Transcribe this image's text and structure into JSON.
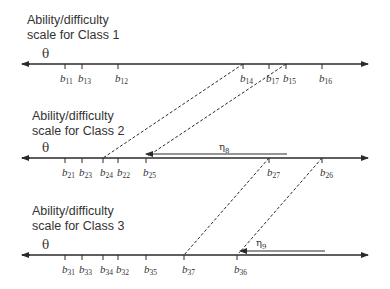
{
  "diagram": {
    "colors": {
      "line": "#2a2a2a",
      "text": "#333333",
      "background": "#ffffff"
    },
    "classes": [
      {
        "title_line1": "Ability/difficulty",
        "title_line2": "scale for Class 1",
        "theta": "θ",
        "ticks": [
          {
            "label": "b",
            "sub": "11",
            "x": 65
          },
          {
            "label": "b",
            "sub": "13",
            "x": 82
          },
          {
            "label": "b",
            "sub": "12",
            "x": 118
          },
          {
            "label": "b",
            "sub": "14",
            "x": 243
          },
          {
            "label": "b",
            "sub": "17",
            "x": 269
          },
          {
            "label": "b",
            "sub": "15",
            "x": 286
          },
          {
            "label": "b",
            "sub": "16",
            "x": 322
          }
        ]
      },
      {
        "title_line1": "Ability/difficulty",
        "title_line2": "scale for Class 2",
        "theta": "θ",
        "ticks": [
          {
            "label": "b",
            "sub": "21",
            "x": 65
          },
          {
            "label": "b",
            "sub": "23",
            "x": 82
          },
          {
            "label": "b",
            "sub": "24",
            "x": 103
          },
          {
            "label": "b",
            "sub": "22",
            "x": 118
          },
          {
            "label": "b",
            "sub": "25",
            "x": 146
          },
          {
            "label": "b",
            "sub": "27",
            "x": 269
          },
          {
            "label": "b",
            "sub": "26",
            "x": 322
          }
        ],
        "shift": {
          "symbol": "η",
          "sub": "8"
        }
      },
      {
        "title_line1": "Ability/difficulty",
        "title_line2": "scale for Class 3",
        "theta": "θ",
        "ticks": [
          {
            "label": "b",
            "sub": "31",
            "x": 65
          },
          {
            "label": "b",
            "sub": "33",
            "x": 82
          },
          {
            "label": "b",
            "sub": "34",
            "x": 103
          },
          {
            "label": "b",
            "sub": "32",
            "x": 118
          },
          {
            "label": "b",
            "sub": "35",
            "x": 146
          },
          {
            "label": "b",
            "sub": "37",
            "x": 184
          },
          {
            "label": "b",
            "sub": "36",
            "x": 237
          }
        ],
        "shift": {
          "symbol": "η",
          "sub": "9"
        }
      }
    ]
  }
}
